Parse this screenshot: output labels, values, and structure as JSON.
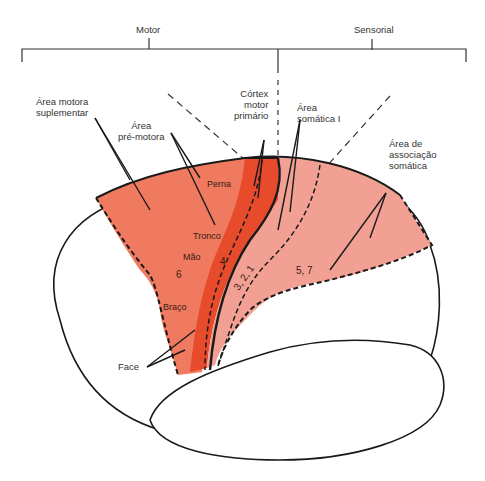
{
  "header": {
    "left_group": "Motor",
    "right_group": "Sensorial"
  },
  "labels": {
    "supplementary_motor": [
      "Área motora",
      "suplementar"
    ],
    "premotor": [
      "Área",
      "pré-motora"
    ],
    "primary_motor": [
      "Córtex",
      "motor",
      "primário"
    ],
    "somatic_1": [
      "Área",
      "somática I"
    ],
    "association": [
      "Área de",
      "associação",
      "somática"
    ]
  },
  "body_parts": {
    "leg": "Perna",
    "trunk": "Tronco",
    "hand": "Mão",
    "arm": "Braço",
    "face": "Face"
  },
  "areas": {
    "premotor_number": "6",
    "motor_number": "4",
    "somatic_numbers": "3, 2, 1",
    "association_numbers": "5, 7"
  },
  "colors": {
    "premotor_fill": "#ef7a5f",
    "motor_fill": "#e84a2c",
    "sensory_fill": "#f2a093",
    "outline": "#1a1a1a"
  }
}
